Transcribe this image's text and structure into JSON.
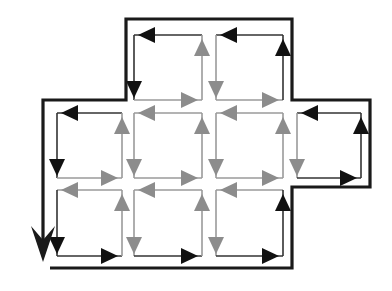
{
  "diagram": {
    "colors": {
      "background": "#ffffff",
      "boundary": "#1a1a1a",
      "edge_arrow": "#111111",
      "interior_arrow": "#8c8c8c",
      "edge_line": "#333333",
      "interior_line": "#9a9a9a"
    },
    "circulation": "counter-clockwise",
    "cells": [
      {
        "id": "A",
        "x1": 134,
        "y1": 35,
        "x2": 202,
        "y2": 100,
        "edges": {
          "top": "edge",
          "left": "edge",
          "bottom": "interior",
          "right": "interior"
        }
      },
      {
        "id": "B",
        "x1": 216,
        "y1": 35,
        "x2": 283,
        "y2": 100,
        "edges": {
          "top": "edge",
          "left": "interior",
          "bottom": "interior",
          "right": "edge"
        }
      },
      {
        "id": "C",
        "x1": 57,
        "y1": 113,
        "x2": 122,
        "y2": 178,
        "edges": {
          "top": "edge",
          "left": "edge",
          "bottom": "interior",
          "right": "interior"
        }
      },
      {
        "id": "D",
        "x1": 134,
        "y1": 113,
        "x2": 202,
        "y2": 178,
        "edges": {
          "top": "interior",
          "left": "interior",
          "bottom": "interior",
          "right": "interior"
        }
      },
      {
        "id": "E",
        "x1": 216,
        "y1": 113,
        "x2": 283,
        "y2": 178,
        "edges": {
          "top": "interior",
          "left": "interior",
          "bottom": "interior",
          "right": "interior"
        }
      },
      {
        "id": "F",
        "x1": 297,
        "y1": 113,
        "x2": 361,
        "y2": 178,
        "edges": {
          "top": "edge",
          "left": "interior",
          "bottom": "edge",
          "right": "edge"
        }
      },
      {
        "id": "G",
        "x1": 57,
        "y1": 190,
        "x2": 122,
        "y2": 256,
        "edges": {
          "top": "interior",
          "left": "edge",
          "bottom": "edge",
          "right": "interior"
        }
      },
      {
        "id": "H",
        "x1": 134,
        "y1": 190,
        "x2": 202,
        "y2": 256,
        "edges": {
          "top": "interior",
          "left": "interior",
          "bottom": "edge",
          "right": "interior"
        }
      },
      {
        "id": "I",
        "x1": 216,
        "y1": 190,
        "x2": 283,
        "y2": 256,
        "edges": {
          "top": "interior",
          "left": "interior",
          "bottom": "edge",
          "right": "edge"
        }
      }
    ],
    "boundary_path": "M 50 268 L 292 268 L 292 187 L 370 187 L 370 100 L 292 100 L 292 19 L 126 19 L 126 100 L 43 100 L 43 240",
    "boundary_arrow": {
      "x": 43,
      "tip_y": 262,
      "direction": "down"
    }
  }
}
